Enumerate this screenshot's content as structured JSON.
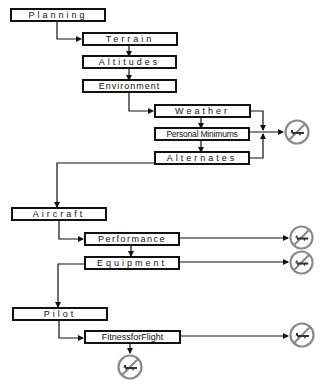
{
  "diagram": {
    "colors": {
      "line": "#111111",
      "nogo": "#8a8a8a",
      "box_fill": "#ffffff"
    },
    "nodes": {
      "planning": "Planning",
      "terrain": "Terrain",
      "altitudes": "Altitudes",
      "environment": "Environment",
      "weather": "Weather",
      "personal_minimums": "Personal Minimums",
      "alternates": "Alternates",
      "aircraft": "Aircraft",
      "performance": "Performance",
      "equipment": "Equipment",
      "pilot": "Pilot",
      "fitness_for_flight": "FitnessforFlight"
    },
    "icons": {
      "nogo": "no-flight-icon"
    }
  }
}
